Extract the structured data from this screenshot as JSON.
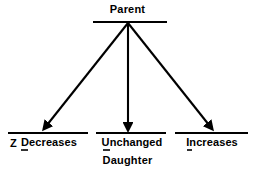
{
  "diagram": {
    "title_top": "Parent",
    "title_bottom": "Daughter",
    "marker_z": "Z",
    "outcomes": [
      {
        "label": "Decreases"
      },
      {
        "label": "Unchanged"
      },
      {
        "label": "Increases"
      }
    ],
    "colors": {
      "ink": "#000000",
      "background": "#ffffff"
    }
  }
}
